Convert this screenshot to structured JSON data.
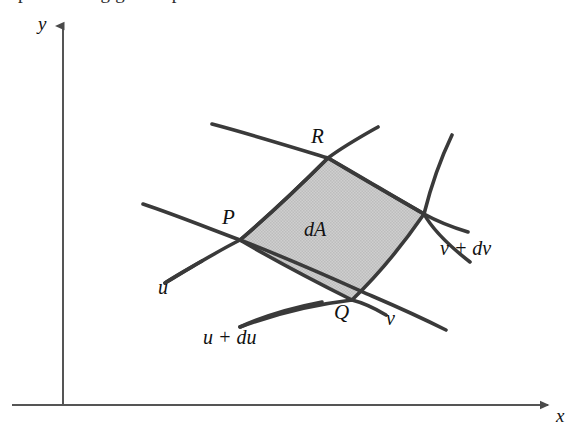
{
  "figure": {
    "type": "math-diagram",
    "background_color": "#ffffff",
    "curve_color": "#3a3a3a",
    "axis_color": "#555555",
    "shaded_fill": "#c8c8c8",
    "shaded_stroke": "#3a3a3a"
  },
  "axes": {
    "x_label": "x",
    "y_label": "y",
    "origin": {
      "x": 63,
      "y": 405
    }
  },
  "points": [
    {
      "id": "P",
      "label": "P",
      "x": 240,
      "y": 240
    },
    {
      "id": "Q",
      "label": "Q",
      "x": 352,
      "y": 300
    },
    {
      "id": "R",
      "label": "R",
      "x": 328,
      "y": 158
    },
    {
      "id": "S",
      "label": "",
      "x": 424,
      "y": 214
    }
  ],
  "curve_labels": {
    "u": "u",
    "u_plus_du": "u + du",
    "v": "v",
    "v_plus_dv": "v + dv"
  },
  "region": {
    "label": "dA",
    "vertices": [
      "P",
      "R",
      "S",
      "Q"
    ]
  },
  "cutoff_text": "p    u    t    n   a   n    g   g   e   n   e  p"
}
